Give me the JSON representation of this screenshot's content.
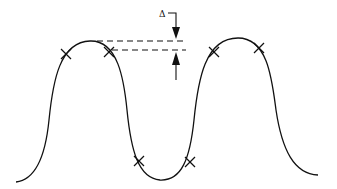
{
  "diagram": {
    "type": "periodic waveform with crossover marks and offset indicator",
    "label": "Δ",
    "stroke_color": "#111111",
    "background": "#ffffff",
    "curve": {
      "description": "two-peak wave with one trough between",
      "peaks": 2,
      "troughs": 1
    },
    "markers": {
      "symbol": "×",
      "count": 6,
      "positions": [
        "left-peak-left",
        "left-peak-right",
        "trough-left",
        "trough-right",
        "right-peak-left",
        "right-peak-right"
      ]
    },
    "offset_indicator": {
      "label": "Δ",
      "lines": "two dashed horizontal reference lines",
      "arrows": [
        "down arrow from above",
        "up arrow from below"
      ]
    }
  }
}
